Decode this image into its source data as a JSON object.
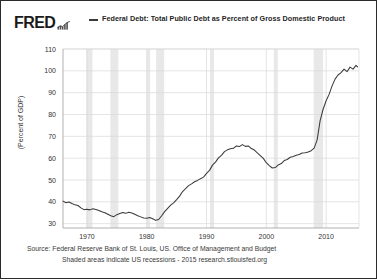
{
  "header": {
    "logo_text": "FRED",
    "logo_icon": "mini-bar-chart-icon",
    "legend_label": "Federal Debt: Total Public Debt as Percent of Gross Domestic Product"
  },
  "footer": {
    "source": "Source: Federal Reserve Bank of St. Louis, US. Office of Management and Budget",
    "note": "Shaded areas indicate US recessions - 2015 research.stlouisfed.org"
  },
  "colors": {
    "line": "#3a3a3a",
    "grid": "#d9d9d9",
    "axis": "#a8a8a8",
    "recession_band": "#e8e8e8",
    "plot_background": "#ffffff",
    "card_border": "#2b2b2b",
    "text": "#333333"
  },
  "chart_data": {
    "type": "line",
    "title": "Federal Debt: Total Public Debt as Percent of Gross Domestic Product",
    "xlabel": "",
    "ylabel": "(Percent of GDP)",
    "xlim": [
      1966,
      2015.5
    ],
    "ylim": [
      28,
      110
    ],
    "yticks": [
      30,
      40,
      50,
      60,
      70,
      80,
      90,
      100,
      110
    ],
    "xticks": [
      1970,
      1980,
      1990,
      2000,
      2010
    ],
    "grid": true,
    "legend_position": "top",
    "units": "Percent of GDP",
    "series": [
      {
        "name": "Federal Debt: Total Public Debt as Percent of Gross Domestic Product",
        "color": "#3a3a3a",
        "x": [
          1966.0,
          1966.5,
          1967.0,
          1967.5,
          1968.0,
          1968.5,
          1969.0,
          1969.5,
          1970.0,
          1970.5,
          1971.0,
          1971.5,
          1972.0,
          1972.5,
          1973.0,
          1973.5,
          1974.0,
          1974.5,
          1975.0,
          1975.5,
          1976.0,
          1976.5,
          1977.0,
          1977.5,
          1978.0,
          1978.5,
          1979.0,
          1979.5,
          1980.0,
          1980.5,
          1981.0,
          1981.5,
          1982.0,
          1982.5,
          1983.0,
          1983.5,
          1984.0,
          1984.5,
          1985.0,
          1985.5,
          1986.0,
          1986.5,
          1987.0,
          1987.5,
          1988.0,
          1988.5,
          1989.0,
          1989.5,
          1990.0,
          1990.5,
          1991.0,
          1991.5,
          1992.0,
          1992.5,
          1993.0,
          1993.5,
          1994.0,
          1994.5,
          1995.0,
          1995.5,
          1996.0,
          1996.5,
          1997.0,
          1997.5,
          1998.0,
          1998.5,
          1999.0,
          1999.5,
          2000.0,
          2000.5,
          2001.0,
          2001.5,
          2002.0,
          2002.5,
          2003.0,
          2003.5,
          2004.0,
          2004.5,
          2005.0,
          2005.5,
          2006.0,
          2006.5,
          2007.0,
          2007.5,
          2008.0,
          2008.5,
          2009.0,
          2009.5,
          2010.0,
          2010.5,
          2011.0,
          2011.5,
          2012.0,
          2012.5,
          2013.0,
          2013.5,
          2014.0,
          2014.5,
          2015.0,
          2015.25
        ],
        "y": [
          40.3,
          39.6,
          39.9,
          39.2,
          38.6,
          38.3,
          37.2,
          36.4,
          36.6,
          36.3,
          36.8,
          36.5,
          36.0,
          35.4,
          35.0,
          34.3,
          33.6,
          33.2,
          34.1,
          34.6,
          35.1,
          34.7,
          35.2,
          34.9,
          34.3,
          33.6,
          33.1,
          32.6,
          32.5,
          32.8,
          32.2,
          31.5,
          31.9,
          33.6,
          35.5,
          37.0,
          38.5,
          39.5,
          41.0,
          42.6,
          44.7,
          46.0,
          47.4,
          48.2,
          49.2,
          49.8,
          50.6,
          51.3,
          53.0,
          54.4,
          56.8,
          58.2,
          60.1,
          61.3,
          63.0,
          63.8,
          64.3,
          64.5,
          65.6,
          65.3,
          66.2,
          65.4,
          65.6,
          64.4,
          63.7,
          62.4,
          61.2,
          59.9,
          57.9,
          56.6,
          55.5,
          55.7,
          56.9,
          57.5,
          58.9,
          59.4,
          60.4,
          60.8,
          61.3,
          61.7,
          62.4,
          62.5,
          62.8,
          63.4,
          64.6,
          68.4,
          77.2,
          82.4,
          86.3,
          89.2,
          93.1,
          96.2,
          98.1,
          99.2,
          100.8,
          99.6,
          101.7,
          100.8,
          102.5,
          101.8
        ]
      }
    ],
    "recessions": [
      {
        "start": 1969.92,
        "end": 1970.92
      },
      {
        "start": 1973.92,
        "end": 1975.25
      },
      {
        "start": 1980.0,
        "end": 1980.58
      },
      {
        "start": 1981.58,
        "end": 1982.92
      },
      {
        "start": 1990.58,
        "end": 1991.25
      },
      {
        "start": 2001.25,
        "end": 2001.92
      },
      {
        "start": 2007.92,
        "end": 2009.5
      }
    ]
  }
}
